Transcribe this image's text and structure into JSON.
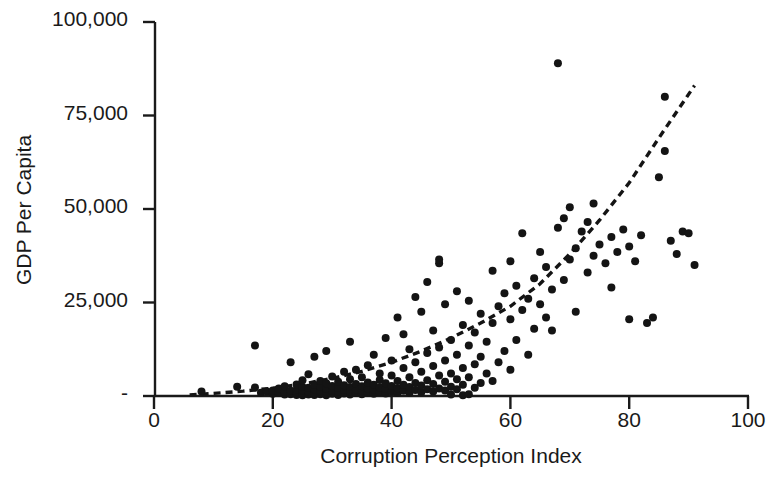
{
  "chart_data": {
    "type": "scatter",
    "title": "",
    "xlabel": "Corruption Perception Index",
    "ylabel": "GDP Per Capita",
    "xlim": [
      0,
      100
    ],
    "ylim": [
      0,
      100000
    ],
    "xticks": [
      0,
      20,
      40,
      60,
      80,
      100
    ],
    "xtick_labels": [
      "0",
      "20",
      "40",
      "60",
      "80",
      "100"
    ],
    "yticks": [
      0,
      25000,
      50000,
      75000,
      100000
    ],
    "ytick_labels": [
      "-",
      "25,000",
      "50,000",
      "75,000",
      "100,000"
    ],
    "grid": false,
    "legend": null,
    "marker_color": "#141414",
    "marker_size_px": 8,
    "trendline": {
      "style": "dashed",
      "color": "#141414",
      "description": "Exponential fit rising from near zero at low CPI to about 83,000 at CPI 91",
      "points": [
        [
          6,
          300
        ],
        [
          10,
          700
        ],
        [
          15,
          1300
        ],
        [
          20,
          2100
        ],
        [
          25,
          3200
        ],
        [
          30,
          4700
        ],
        [
          35,
          6600
        ],
        [
          40,
          9000
        ],
        [
          45,
          12000
        ],
        [
          50,
          15500
        ],
        [
          55,
          19500
        ],
        [
          60,
          24000
        ],
        [
          65,
          30000
        ],
        [
          70,
          38000
        ],
        [
          75,
          47000
        ],
        [
          80,
          57000
        ],
        [
          85,
          69000
        ],
        [
          88,
          76000
        ],
        [
          91,
          83000
        ]
      ]
    },
    "points": [
      [
        8,
        1200
      ],
      [
        14,
        2500
      ],
      [
        17,
        2300
      ],
      [
        17,
        13500
      ],
      [
        18,
        900
      ],
      [
        19,
        1200
      ],
      [
        20,
        600
      ],
      [
        20,
        1500
      ],
      [
        21,
        900
      ],
      [
        21,
        2000
      ],
      [
        22,
        400
      ],
      [
        22,
        1100
      ],
      [
        22,
        2600
      ],
      [
        23,
        500
      ],
      [
        23,
        1400
      ],
      [
        23,
        9000
      ],
      [
        24,
        300
      ],
      [
        24,
        900
      ],
      [
        24,
        1700
      ],
      [
        24,
        3100
      ],
      [
        25,
        200
      ],
      [
        25,
        800
      ],
      [
        25,
        1500
      ],
      [
        25,
        2400
      ],
      [
        25,
        4200
      ],
      [
        26,
        400
      ],
      [
        26,
        1100
      ],
      [
        26,
        2200
      ],
      [
        26,
        5800
      ],
      [
        27,
        300
      ],
      [
        27,
        900
      ],
      [
        27,
        1800
      ],
      [
        27,
        3000
      ],
      [
        27,
        10500
      ],
      [
        28,
        500
      ],
      [
        28,
        1300
      ],
      [
        28,
        2500
      ],
      [
        28,
        4000
      ],
      [
        29,
        200
      ],
      [
        29,
        1000
      ],
      [
        29,
        1900
      ],
      [
        29,
        3400
      ],
      [
        29,
        12000
      ],
      [
        30,
        600
      ],
      [
        30,
        1400
      ],
      [
        30,
        2700
      ],
      [
        30,
        5200
      ],
      [
        31,
        300
      ],
      [
        31,
        1200
      ],
      [
        31,
        2200
      ],
      [
        31,
        3800
      ],
      [
        32,
        700
      ],
      [
        32,
        1600
      ],
      [
        32,
        2900
      ],
      [
        32,
        6500
      ],
      [
        33,
        400
      ],
      [
        33,
        1300
      ],
      [
        33,
        2400
      ],
      [
        33,
        4500
      ],
      [
        33,
        14500
      ],
      [
        34,
        800
      ],
      [
        34,
        1800
      ],
      [
        34,
        3200
      ],
      [
        34,
        7000
      ],
      [
        35,
        500
      ],
      [
        35,
        1500
      ],
      [
        35,
        2600
      ],
      [
        35,
        5000
      ],
      [
        36,
        900
      ],
      [
        36,
        2000
      ],
      [
        36,
        3600
      ],
      [
        36,
        8200
      ],
      [
        37,
        600
      ],
      [
        37,
        1700
      ],
      [
        37,
        3000
      ],
      [
        37,
        11000
      ],
      [
        38,
        1100
      ],
      [
        38,
        2300
      ],
      [
        38,
        4300
      ],
      [
        38,
        6000
      ],
      [
        39,
        700
      ],
      [
        39,
        1900
      ],
      [
        39,
        3400
      ],
      [
        39,
        15500
      ],
      [
        40,
        1200
      ],
      [
        40,
        2700
      ],
      [
        40,
        5500
      ],
      [
        40,
        9500
      ],
      [
        41,
        800
      ],
      [
        41,
        2100
      ],
      [
        41,
        4000
      ],
      [
        41,
        21000
      ],
      [
        42,
        1400
      ],
      [
        42,
        3000
      ],
      [
        42,
        7500
      ],
      [
        42,
        16500
      ],
      [
        43,
        900
      ],
      [
        43,
        2400
      ],
      [
        43,
        5000
      ],
      [
        43,
        12500
      ],
      [
        44,
        1600
      ],
      [
        44,
        3500
      ],
      [
        44,
        9000
      ],
      [
        44,
        26500
      ],
      [
        45,
        1000
      ],
      [
        45,
        2800
      ],
      [
        45,
        6500
      ],
      [
        45,
        22500
      ],
      [
        46,
        1800
      ],
      [
        46,
        4200
      ],
      [
        46,
        11500
      ],
      [
        46,
        30500
      ],
      [
        47,
        1200
      ],
      [
        47,
        3200
      ],
      [
        47,
        8000
      ],
      [
        47,
        17500
      ],
      [
        48,
        2000
      ],
      [
        48,
        5500
      ],
      [
        48,
        13000
      ],
      [
        48,
        35500
      ],
      [
        48,
        36500
      ],
      [
        49,
        1500
      ],
      [
        49,
        3800
      ],
      [
        49,
        9500
      ],
      [
        49,
        24500
      ],
      [
        50,
        400
      ],
      [
        50,
        2500
      ],
      [
        50,
        6000
      ],
      [
        50,
        15000
      ],
      [
        51,
        1800
      ],
      [
        51,
        4500
      ],
      [
        51,
        11000
      ],
      [
        51,
        28000
      ],
      [
        52,
        200
      ],
      [
        52,
        3000
      ],
      [
        52,
        7500
      ],
      [
        52,
        19000
      ],
      [
        53,
        500
      ],
      [
        53,
        5000
      ],
      [
        53,
        13500
      ],
      [
        53,
        25500
      ],
      [
        54,
        2200
      ],
      [
        54,
        8500
      ],
      [
        54,
        17000
      ],
      [
        55,
        3500
      ],
      [
        55,
        10500
      ],
      [
        55,
        22000
      ],
      [
        56,
        6000
      ],
      [
        56,
        14500
      ],
      [
        57,
        4000
      ],
      [
        57,
        19500
      ],
      [
        57,
        33500
      ],
      [
        58,
        9000
      ],
      [
        58,
        24000
      ],
      [
        59,
        12000
      ],
      [
        59,
        27500
      ],
      [
        60,
        7000
      ],
      [
        60,
        20500
      ],
      [
        60,
        36000
      ],
      [
        61,
        15000
      ],
      [
        61,
        29500
      ],
      [
        62,
        23000
      ],
      [
        62,
        43500
      ],
      [
        63,
        11000
      ],
      [
        63,
        26000
      ],
      [
        64,
        18000
      ],
      [
        64,
        31500
      ],
      [
        65,
        24500
      ],
      [
        65,
        38500
      ],
      [
        66,
        21000
      ],
      [
        66,
        34500
      ],
      [
        67,
        17500
      ],
      [
        67,
        28500
      ],
      [
        68,
        89000
      ],
      [
        68,
        45000
      ],
      [
        69,
        31000
      ],
      [
        69,
        47500
      ],
      [
        70,
        36500
      ],
      [
        70,
        50500
      ],
      [
        71,
        22500
      ],
      [
        71,
        39500
      ],
      [
        72,
        44000
      ],
      [
        73,
        33000
      ],
      [
        73,
        46500
      ],
      [
        74,
        37500
      ],
      [
        74,
        51500
      ],
      [
        75,
        40500
      ],
      [
        76,
        35500
      ],
      [
        77,
        29000
      ],
      [
        77,
        42500
      ],
      [
        78,
        38500
      ],
      [
        79,
        44500
      ],
      [
        80,
        40000
      ],
      [
        80,
        20500
      ],
      [
        81,
        36000
      ],
      [
        82,
        43000
      ],
      [
        83,
        19500
      ],
      [
        84,
        21000
      ],
      [
        85,
        58500
      ],
      [
        86,
        80000
      ],
      [
        86,
        65500
      ],
      [
        87,
        41500
      ],
      [
        88,
        38000
      ],
      [
        89,
        44000
      ],
      [
        90,
        43500
      ],
      [
        91,
        35000
      ]
    ]
  }
}
